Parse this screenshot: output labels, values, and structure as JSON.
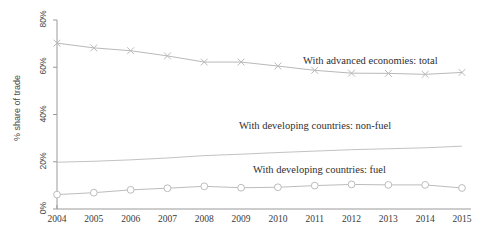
{
  "chart_data": {
    "type": "line",
    "title": "",
    "subtitle": "",
    "xlabel": "",
    "ylabel": "% share of trade",
    "x": [
      2004,
      2005,
      2006,
      2007,
      2008,
      2009,
      2010,
      2011,
      2012,
      2013,
      2014,
      2015
    ],
    "xtick_labels": [
      "2004",
      "2005",
      "2006",
      "2007",
      "2008",
      "2009",
      "2010",
      "2011",
      "2012",
      "2013",
      "2014",
      "2015"
    ],
    "ytick_labels": [
      "0%",
      "20%",
      "40%",
      "60%",
      "80%"
    ],
    "ytick_values": [
      0,
      20,
      40,
      60,
      80
    ],
    "ylim": [
      0,
      80
    ],
    "xlim": [
      2004,
      2015
    ],
    "grid": false,
    "legend_position": "inline-annotation",
    "series": [
      {
        "name": "With advanced economies: total",
        "marker": "x",
        "color": "#b9b9b9",
        "label_x": 303,
        "label_y": 55,
        "values": [
          70.2,
          68.2,
          67.0,
          64.8,
          62.2,
          62.2,
          60.5,
          58.7,
          57.5,
          57.4,
          57.0,
          57.8
        ]
      },
      {
        "name": "With developing countries: non-fuel",
        "marker": "none",
        "color": "#c2c2c2",
        "label_x": 239,
        "label_y": 120,
        "values": [
          19.8,
          20.2,
          20.8,
          21.6,
          22.6,
          23.2,
          23.9,
          24.5,
          25.1,
          25.5,
          25.9,
          26.6
        ]
      },
      {
        "name": "With developing countries: fuel",
        "marker": "o",
        "color": "#bcbcbc",
        "label_x": 253,
        "label_y": 164,
        "values": [
          6.1,
          6.9,
          8.1,
          8.8,
          9.6,
          9.0,
          9.2,
          9.9,
          10.4,
          10.2,
          10.2,
          8.9
        ]
      }
    ]
  },
  "axis": {
    "line_color": "#9a9a9a",
    "plot_left": 57,
    "plot_right": 462,
    "plot_top": 20,
    "plot_bottom": 209
  }
}
